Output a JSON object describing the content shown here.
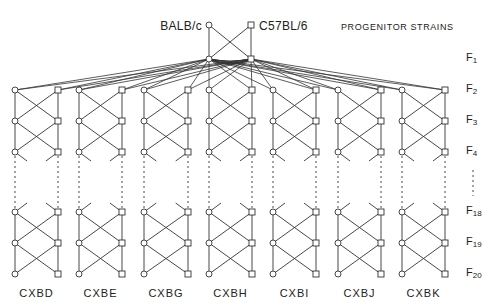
{
  "diagram": {
    "title": "PROGENITOR STRAINS",
    "parents": [
      {
        "label": "BALB/c",
        "symbol": "circle",
        "x": 209,
        "y": 25
      },
      {
        "label": "C57BL/6",
        "symbol": "square",
        "x": 251,
        "y": 25
      }
    ],
    "f1_nodes": [
      {
        "symbol": "circle",
        "x": 209,
        "y": 59
      },
      {
        "symbol": "square",
        "x": 251,
        "y": 59
      }
    ],
    "generations": [
      {
        "label": "F",
        "sub": "1",
        "y": 59
      },
      {
        "label": "F",
        "sub": "2",
        "y": 90
      },
      {
        "label": "F",
        "sub": "3",
        "y": 121
      },
      {
        "label": "F",
        "sub": "4",
        "y": 152
      },
      {
        "label": "F",
        "sub": "18",
        "y": 212
      },
      {
        "label": "F",
        "sub": "19",
        "y": 243
      },
      {
        "label": "F",
        "sub": "20",
        "y": 274
      }
    ],
    "node_rows_y": [
      90,
      121,
      152,
      212,
      243,
      274
    ],
    "gap": {
      "from_y": 156,
      "to_y": 208,
      "label_line_x": 473,
      "label_line_from": 170,
      "label_line_to": 196
    },
    "strains": [
      {
        "name": "CXBD",
        "left_x": 15,
        "right_x": 58
      },
      {
        "name": "CXBE",
        "left_x": 79,
        "right_x": 122
      },
      {
        "name": "CXBG",
        "left_x": 144,
        "right_x": 188
      },
      {
        "name": "CXBH",
        "left_x": 209,
        "right_x": 252
      },
      {
        "name": "CXBI",
        "left_x": 273,
        "right_x": 316
      },
      {
        "name": "CXBJ",
        "left_x": 338,
        "right_x": 381
      },
      {
        "name": "CXBK",
        "left_x": 402,
        "right_x": 445
      }
    ],
    "colors": {
      "line": "#333333",
      "node_fill": "#ffffff",
      "text": "#222222"
    }
  }
}
